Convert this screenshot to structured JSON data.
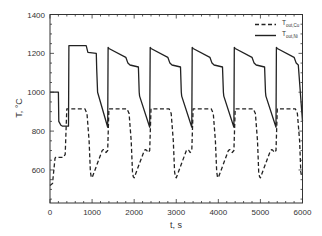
{
  "chart_data": {
    "type": "line",
    "title": "",
    "xlabel": "t, s",
    "ylabel": "T, °C",
    "xlim": [
      0,
      6000
    ],
    "ylim": [
      430,
      1400
    ],
    "xticks": [
      0,
      1000,
      2000,
      3000,
      4000,
      5000,
      6000
    ],
    "yticks": [
      600,
      800,
      1000,
      1200,
      1400
    ],
    "ytick_labels": [
      "600",
      "800",
      "1000",
      "1200",
      "1400"
    ],
    "xtick_labels": [
      "0",
      "1000",
      "2000",
      "3000",
      "4000",
      "5000",
      "6000"
    ],
    "y_origin_label": "0",
    "grid": false,
    "legend_position": "upper right",
    "series": [
      {
        "name": "T_out,Cu",
        "label_main": "T",
        "label_sub": "out,Cu",
        "style": "dashed",
        "color": "#222222",
        "x": [
          0,
          60,
          120,
          140,
          320,
          360,
          400,
          830,
          880,
          930,
          960,
          980,
          1000,
          1240,
          1270,
          1300,
          1330,
          1370,
          1400,
          1830,
          1880,
          1930,
          1960,
          1980,
          2000,
          2240,
          2270,
          2300,
          2330,
          2370,
          2400,
          2830,
          2880,
          2930,
          2960,
          2980,
          3000,
          3240,
          3270,
          3300,
          3330,
          3370,
          3400,
          3830,
          3880,
          3930,
          3960,
          3980,
          4000,
          4240,
          4270,
          4300,
          4330,
          4370,
          4400,
          4830,
          4880,
          4930,
          4960,
          4980,
          5000,
          5240,
          5270,
          5300,
          5330,
          5370,
          5400,
          5830,
          5880,
          5930,
          5960,
          5980,
          6000
        ],
        "y": [
          520,
          530,
          660,
          665,
          665,
          680,
          915,
          915,
          890,
          750,
          590,
          565,
          560,
          700,
          705,
          700,
          690,
          700,
          915,
          915,
          890,
          750,
          590,
          565,
          560,
          700,
          705,
          700,
          690,
          700,
          915,
          915,
          890,
          750,
          590,
          565,
          560,
          700,
          705,
          700,
          690,
          700,
          915,
          915,
          890,
          750,
          590,
          565,
          560,
          700,
          705,
          700,
          690,
          700,
          915,
          915,
          890,
          750,
          590,
          565,
          560,
          700,
          705,
          700,
          690,
          700,
          915,
          915,
          890,
          750,
          590,
          565,
          565
        ]
      },
      {
        "name": "T_out,Ni",
        "label_main": "T",
        "label_sub": "out,Ni",
        "style": "solid",
        "color": "#222222",
        "x": [
          0,
          200,
          210,
          260,
          300,
          440,
          450,
          860,
          900,
          1100,
          1110,
          1130,
          1370,
          1380,
          1400,
          1800,
          1850,
          1900,
          2100,
          2120,
          2130,
          2370,
          2380,
          2400,
          2800,
          2850,
          2900,
          3100,
          3120,
          3130,
          3370,
          3380,
          3400,
          3800,
          3850,
          3900,
          4100,
          4120,
          4130,
          4370,
          4380,
          4400,
          4800,
          4850,
          4900,
          5100,
          5120,
          5130,
          5370,
          5380,
          5400,
          5800,
          5850,
          5900,
          6000
        ],
        "y": [
          1000,
          1000,
          850,
          830,
          825,
          825,
          1240,
          1240,
          1205,
          1200,
          1120,
          1000,
          820,
          1230,
          1225,
          1180,
          1150,
          1140,
          1130,
          1000,
          980,
          820,
          1230,
          1225,
          1180,
          1150,
          1140,
          1130,
          1000,
          980,
          820,
          1230,
          1225,
          1180,
          1150,
          1140,
          1130,
          1000,
          980,
          820,
          1230,
          1225,
          1180,
          1150,
          1140,
          1130,
          1000,
          980,
          820,
          1230,
          1225,
          1180,
          1150,
          1140,
          850
        ]
      }
    ]
  }
}
